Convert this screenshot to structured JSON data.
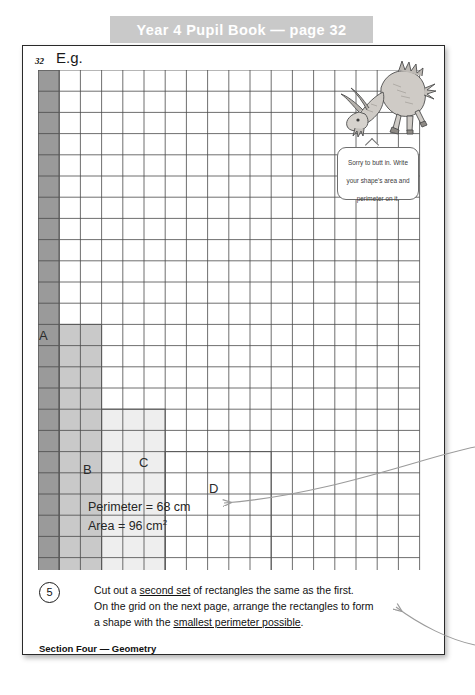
{
  "banner": {
    "title": "Year 4 Pupil Book — page 32"
  },
  "page": {
    "number": "32",
    "example_label": "E.g.",
    "footer": "Section Four — Geometry"
  },
  "speech_bubble": {
    "text": "Sorry to butt in.  Write your shape's area and perimeter on it."
  },
  "grid": {
    "columns": 18,
    "rows": 24,
    "cell_size": 21.2,
    "line_color": "#4a4a4a"
  },
  "rectangles": [
    {
      "label": "A",
      "fill": "#9a9a9a",
      "x": 0,
      "y": 0,
      "w": 1,
      "h": 24
    },
    {
      "label": "B",
      "fill": "#c9c9c9",
      "x": 1,
      "y": 12,
      "w": 2,
      "h": 12
    },
    {
      "label": "C",
      "fill": "#eeeeee",
      "x": 3,
      "y": 16,
      "w": 3,
      "h": 8
    },
    {
      "label": "D",
      "fill": "#ffffff",
      "x": 6,
      "y": 18,
      "w": 5,
      "h": 6
    }
  ],
  "measurements": {
    "perimeter_label": "Perimeter = 68 cm",
    "area_label": "Area = 96 cm",
    "area_unit_sup": "2"
  },
  "question": {
    "number": "5",
    "line1_a": "Cut out a ",
    "line1_u": "second set",
    "line1_b": " of rectangles the same as the first.",
    "line2": "On the grid on the next page, arrange the rectangles to form",
    "line3_a": "a shape with the ",
    "line3_u": "smallest perimeter possible",
    "line3_b": "."
  },
  "annotations": {
    "arrow_middle_name": "callout-arrow-to-measurements",
    "arrow_bottom_name": "callout-arrow-to-question"
  },
  "colors": {
    "banner_bg": "#c9c9c9",
    "banner_text": "#ffffff",
    "page_border": "#2a2a2a",
    "grid_line": "#4a4a4a",
    "arrow": "#9b9b9b"
  }
}
